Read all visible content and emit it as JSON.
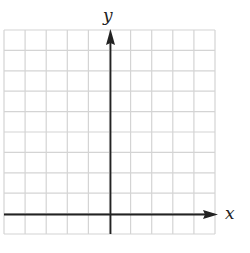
{
  "diagram": {
    "type": "coordinate-grid",
    "axes": {
      "x_label": "x",
      "y_label": "y",
      "x_arrow": "positive-direction",
      "y_arrow": "positive-direction"
    },
    "grid": {
      "columns": 10,
      "rows": 10,
      "columns_left_of_y_axis": 5,
      "columns_right_of_y_axis": 5,
      "rows_above_x_axis": 9,
      "rows_below_x_axis": 1
    },
    "colors": {
      "grid_line": "#d4d4d4",
      "axis_line": "#222222",
      "background": "#ffffff"
    }
  }
}
